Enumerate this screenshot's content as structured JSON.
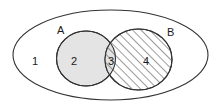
{
  "figure": {
    "type": "venn-diagram",
    "title": "",
    "background_color": "#ffffff",
    "stroke_color": "#333333",
    "universe": {
      "name": "universal-set",
      "shape": "ellipse",
      "label": "",
      "fill": "#ffffff"
    },
    "sets": [
      {
        "id": "A",
        "label": "A",
        "shape": "ellipse",
        "fill": "#e4e4e4",
        "fill_style": "solid-gray",
        "label_position": "top-left"
      },
      {
        "id": "B",
        "label": "B",
        "shape": "circle",
        "fill": "#ffffff",
        "fill_style": "diagonal-hatch",
        "label_position": "top-right"
      }
    ],
    "regions": [
      {
        "id": "region-1",
        "label": "1",
        "description": "outside A and outside B, inside universe",
        "fill_style": "none"
      },
      {
        "id": "region-2",
        "label": "2",
        "description": "A only",
        "fill_style": "solid-gray"
      },
      {
        "id": "region-3",
        "label": "3",
        "description": "A intersect B",
        "fill_style": "gray-with-hatch"
      },
      {
        "id": "region-4",
        "label": "4",
        "description": "B only",
        "fill_style": "diagonal-hatch"
      }
    ]
  }
}
